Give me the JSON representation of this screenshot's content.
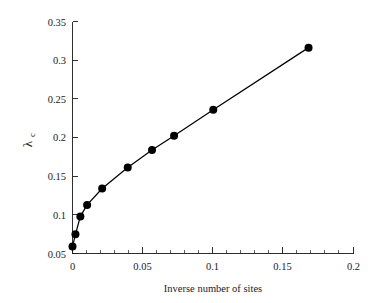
{
  "chart_data": {
    "type": "line",
    "title": "",
    "subtitle": "",
    "xlabel": "Inverse number of sites",
    "ylabel": "λ",
    "ylabel_subscript": "c",
    "ylabel_full": "λ_c",
    "xlim": [
      0,
      0.2
    ],
    "ylim": [
      0.05,
      0.35
    ],
    "xticks": [
      0,
      0.05,
      0.1,
      0.15,
      0.2
    ],
    "xticklabels": [
      "0",
      "0.05",
      "0.1",
      "0.15",
      "0.2"
    ],
    "xtick_minor_step": 0.01,
    "yticks": [
      0.05,
      0.1,
      0.15,
      0.2,
      0.25,
      0.3,
      0.35
    ],
    "yticklabels": [
      "0.05",
      "0.1",
      "0.15",
      "0.2",
      "0.25",
      "0.3",
      "0.35"
    ],
    "grid": false,
    "legend": false,
    "legend_position": "none",
    "marker": "filled-circle",
    "marker_color": "#000000",
    "line_color": "#000000",
    "axes_color": "#1a1a1a",
    "background_color": "#ffffff",
    "series": [
      {
        "name": "lambda_c vs inverse number of sites",
        "x": [
          0.0,
          0.0021,
          0.0056,
          0.0104,
          0.0211,
          0.0393,
          0.0566,
          0.0723,
          0.1002,
          0.168
        ],
        "y": [
          0.059,
          0.0748,
          0.098,
          0.1128,
          0.134,
          0.1612,
          0.1838,
          0.2023,
          0.236,
          0.3162
        ]
      }
    ]
  },
  "figure": {
    "xlabel": "Inverse number of sites",
    "ylabel_main": "λ",
    "ylabel_sub": "c"
  }
}
